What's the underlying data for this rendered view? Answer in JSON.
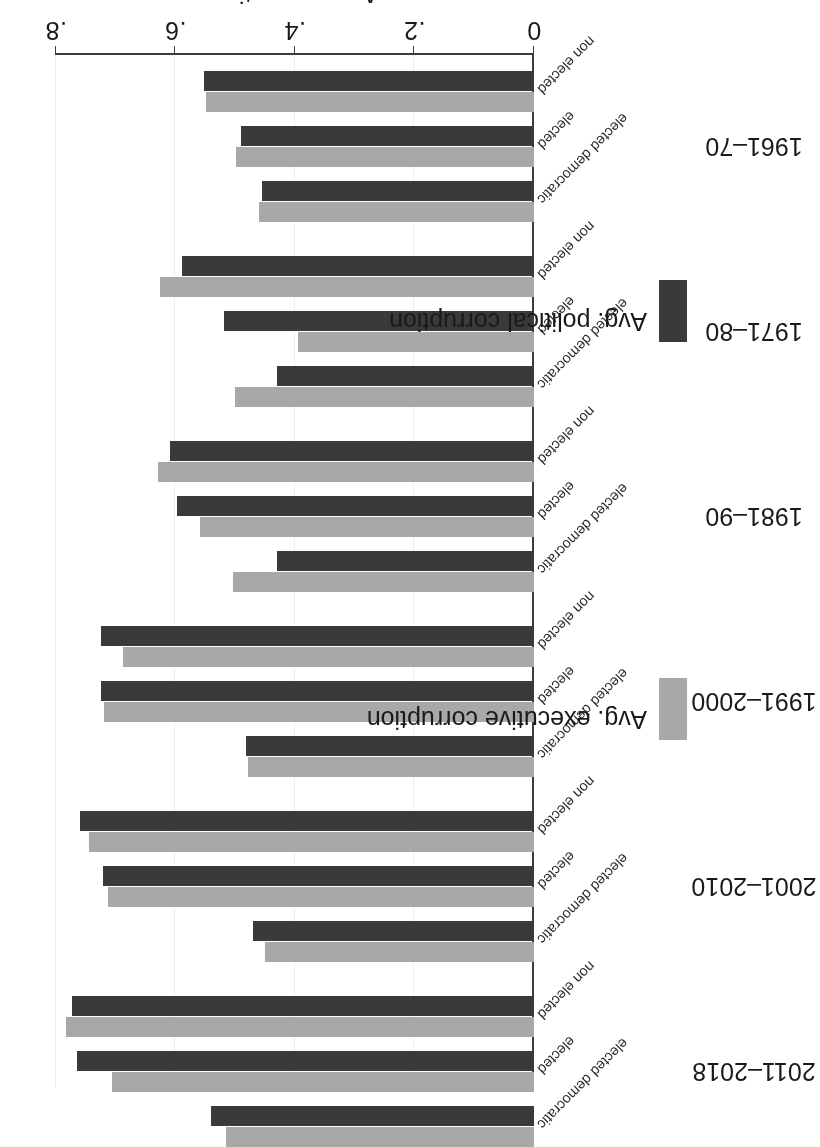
{
  "chart_data": {
    "type": "bar",
    "orientation": "horizontal",
    "title": "",
    "xlabel": "Avg. corruption",
    "ylabel": "",
    "xlim": [
      0,
      0.8
    ],
    "xticks": [
      "0",
      ".2",
      ".4",
      ".6",
      ".8"
    ],
    "xtick_values": [
      0,
      0.2,
      0.4,
      0.6,
      0.8
    ],
    "grid": true,
    "rotated_180": true,
    "legend_position": "bottom",
    "legend": [
      {
        "name": "Avg. political corruption",
        "color": "#3a3a3a"
      },
      {
        "name": "Avg. executive corruption",
        "color": "#a8a8a8"
      }
    ],
    "group_labels": [
      "1961–70",
      "1971–80",
      "1981–90",
      "1991–2000",
      "2001–2010",
      "2011–2018"
    ],
    "case_labels": [
      "non elected",
      "elected",
      "elected democratic"
    ],
    "series": [
      {
        "name": "Avg. political corruption",
        "color": "#3a3a3a",
        "values": [
          0.552,
          0.49,
          0.455,
          0.589,
          0.518,
          0.43,
          0.609,
          0.597,
          0.43,
          0.724,
          0.725,
          0.482,
          0.76,
          0.721,
          0.47,
          0.774,
          0.765,
          0.54
        ]
      },
      {
        "name": "Avg. executive corruption",
        "color": "#a8a8a8",
        "values": [
          0.549,
          0.499,
          0.46,
          0.626,
          0.395,
          0.5,
          0.629,
          0.559,
          0.504,
          0.688,
          0.72,
          0.479,
          0.745,
          0.713,
          0.45,
          0.783,
          0.706,
          0.515
        ]
      }
    ],
    "bars": [
      {
        "group": "1961–70",
        "case": "non elected",
        "political": 0.552,
        "executive": 0.549
      },
      {
        "group": "1961–70",
        "case": "elected",
        "political": 0.49,
        "executive": 0.499
      },
      {
        "group": "1961–70",
        "case": "elected democratic",
        "political": 0.455,
        "executive": 0.46
      },
      {
        "group": "1971–80",
        "case": "non elected",
        "political": 0.589,
        "executive": 0.626
      },
      {
        "group": "1971–80",
        "case": "elected",
        "political": 0.518,
        "executive": 0.395
      },
      {
        "group": "1971–80",
        "case": "elected democratic",
        "political": 0.43,
        "executive": 0.5
      },
      {
        "group": "1981–90",
        "case": "non elected",
        "political": 0.609,
        "executive": 0.629
      },
      {
        "group": "1981–90",
        "case": "elected",
        "political": 0.597,
        "executive": 0.559
      },
      {
        "group": "1981–90",
        "case": "elected democratic",
        "political": 0.43,
        "executive": 0.504
      },
      {
        "group": "1991–2000",
        "case": "non elected",
        "political": 0.724,
        "executive": 0.688
      },
      {
        "group": "1991–2000",
        "case": "elected",
        "political": 0.725,
        "executive": 0.72
      },
      {
        "group": "1991–2000",
        "case": "elected democratic",
        "political": 0.482,
        "executive": 0.479
      },
      {
        "group": "2001–2010",
        "case": "non elected",
        "political": 0.76,
        "executive": 0.745
      },
      {
        "group": "2001–2010",
        "case": "elected",
        "political": 0.721,
        "executive": 0.713
      },
      {
        "group": "2001–2010",
        "case": "elected democratic",
        "political": 0.47,
        "executive": 0.45
      },
      {
        "group": "2011–2018",
        "case": "non elected",
        "political": 0.774,
        "executive": 0.783
      },
      {
        "group": "2011–2018",
        "case": "elected",
        "political": 0.765,
        "executive": 0.706
      },
      {
        "group": "2011–2018",
        "case": "elected democratic",
        "political": 0.54,
        "executive": 0.515
      }
    ]
  }
}
